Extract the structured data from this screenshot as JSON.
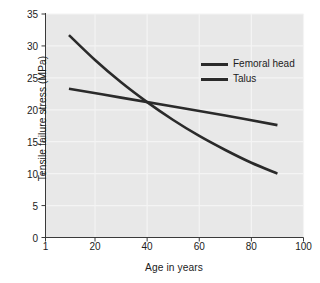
{
  "chart_data": {
    "type": "line",
    "title": "",
    "xlabel": "Age in years",
    "ylabel": "Tensile failure stress (MPa)",
    "xlim": [
      1,
      100
    ],
    "ylim": [
      0,
      35
    ],
    "xticks": [
      "1",
      "20",
      "40",
      "60",
      "80",
      "100"
    ],
    "xtick_values": [
      1,
      20,
      40,
      60,
      80,
      100
    ],
    "yticks": [
      "0",
      "5",
      "10",
      "15",
      "20",
      "25",
      "30",
      "35"
    ],
    "ytick_values": [
      0,
      5,
      10,
      15,
      20,
      25,
      30,
      35
    ],
    "grid": true,
    "legend_position": "upper right inside",
    "series": [
      {
        "name": "Femoral head",
        "color": "#2a2a2a",
        "x": [
          10,
          20,
          30,
          40,
          50,
          60,
          70,
          80,
          90
        ],
        "values": [
          31.7,
          27.8,
          24.3,
          21.2,
          18.4,
          15.9,
          13.7,
          11.7,
          10.0
        ]
      },
      {
        "name": "Talus",
        "color": "#2a2a2a",
        "x": [
          10,
          30,
          50,
          70,
          90
        ],
        "values": [
          23.3,
          21.9,
          20.5,
          19.1,
          17.6
        ]
      }
    ],
    "annotations": [
      {
        "label": "curves intersect",
        "x": 38,
        "y": 21.1
      }
    ]
  },
  "legend": {
    "items": [
      {
        "label": "Femoral head"
      },
      {
        "label": "Talus"
      }
    ]
  },
  "axes": {
    "x_title": "Age in years",
    "y_title": "Tensile failure stress (MPa)"
  },
  "colors": {
    "plot_background": "#e8e8e8",
    "page_background": "#ffffff",
    "axis": "#3a3a3a",
    "gridline": "#f4f4f4",
    "line": "#2a2a2a",
    "text": "#1c1c1c"
  }
}
